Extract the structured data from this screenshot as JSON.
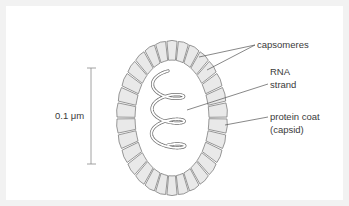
{
  "figure": {
    "scale_bar": {
      "label": "0.1 μm",
      "value": "0.1",
      "unit": "μm"
    },
    "labels": {
      "capsomeres": "capsomeres",
      "rna_line1": "RNA",
      "rna_line2": "strand",
      "coat_line1": "protein coat",
      "coat_line2": "(capsid)"
    },
    "capsomere_count": 30,
    "rna_helix_turns": 3,
    "colors": {
      "capsomere_fill": "#e9e9e9",
      "outline": "#6e6e6e",
      "leader": "#555555",
      "text": "#3a3a3a"
    }
  }
}
